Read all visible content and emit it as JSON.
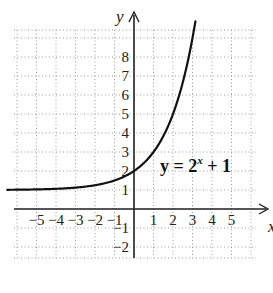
{
  "chart_data": {
    "type": "line",
    "title": "",
    "equation_label": {
      "prefix": "y = 2",
      "exponent": "x",
      "suffix": " + 1"
    },
    "xlabel": "x",
    "ylabel": "y",
    "xlim": [
      -6.5,
      6.5
    ],
    "ylim": [
      -3,
      9.5
    ],
    "x_ticks": [
      -5,
      -4,
      -3,
      -2,
      -1,
      1,
      2,
      3,
      4,
      5
    ],
    "x_tick_labels": [
      "−5",
      "−4",
      "−3",
      "−2",
      "−1",
      "1",
      "2",
      "3",
      "4",
      "5"
    ],
    "y_ticks": [
      -2,
      -1,
      1,
      2,
      3,
      4,
      5,
      6,
      7,
      8
    ],
    "y_tick_labels": [
      "−2",
      "−1",
      "1",
      "2",
      "3",
      "4",
      "5",
      "6",
      "7",
      "8"
    ],
    "grid": true,
    "grid_style": "dotted",
    "series": [
      {
        "name": "y = 2^x + 1",
        "function": "2^x + 1",
        "x_range": [
          -6.5,
          3.17
        ],
        "points": [
          [
            -6,
            1.016
          ],
          [
            -5,
            1.031
          ],
          [
            -4,
            1.063
          ],
          [
            -3,
            1.125
          ],
          [
            -2,
            1.25
          ],
          [
            -1,
            1.5
          ],
          [
            0,
            2
          ],
          [
            1,
            3
          ],
          [
            2,
            5
          ],
          [
            3,
            9
          ]
        ],
        "color": "#111111"
      }
    ],
    "colors": {
      "curve": "#111111",
      "axes": "#222222",
      "grid": "#9a9a9a",
      "background": "#ffffff"
    }
  }
}
